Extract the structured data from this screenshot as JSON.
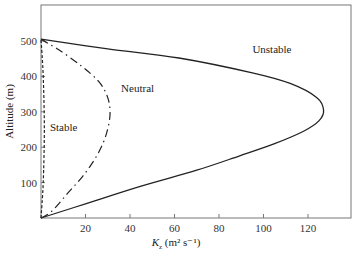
{
  "chart_data": {
    "type": "line",
    "title": "",
    "xlabel": "K_z (m² s⁻¹)",
    "xlabel_parts": {
      "symbol": "K",
      "subscript": "z",
      "units": " (m² s⁻¹)"
    },
    "ylabel": "Altitude (m)",
    "xlim": [
      0,
      138
    ],
    "ylim": [
      0,
      550
    ],
    "xticks": [
      20,
      40,
      60,
      80,
      100,
      120
    ],
    "yticks": [
      100,
      200,
      300,
      400,
      500
    ],
    "grid": false,
    "legend": "none (curves labeled inline)",
    "series": [
      {
        "name": "Unstable",
        "style": "solid",
        "points": [
          [
            0,
            0
          ],
          [
            20,
            40
          ],
          [
            45,
            90
          ],
          [
            70,
            135
          ],
          [
            89,
            175
          ],
          [
            105,
            210
          ],
          [
            118,
            245
          ],
          [
            125,
            275
          ],
          [
            127,
            305
          ],
          [
            124,
            340
          ],
          [
            112,
            380
          ],
          [
            95,
            410
          ],
          [
            62,
            452
          ],
          [
            30,
            478
          ],
          [
            0,
            505
          ]
        ],
        "label_at": [
          95,
          465
        ]
      },
      {
        "name": "Neutral",
        "style": "dashdot",
        "points": [
          [
            0,
            0
          ],
          [
            5,
            20
          ],
          [
            12,
            70
          ],
          [
            19,
            120
          ],
          [
            25,
            175
          ],
          [
            29,
            230
          ],
          [
            31,
            290
          ],
          [
            30,
            340
          ],
          [
            26,
            385
          ],
          [
            18,
            430
          ],
          [
            8,
            475
          ],
          [
            0,
            505
          ]
        ],
        "label_at": [
          36,
          355
        ]
      },
      {
        "name": "Stable",
        "style": "dashed",
        "points": [
          [
            0,
            0
          ],
          [
            1,
            100
          ],
          [
            1.5,
            250
          ],
          [
            1,
            400
          ],
          [
            0,
            505
          ]
        ],
        "label_at": [
          4,
          245
        ]
      }
    ]
  }
}
